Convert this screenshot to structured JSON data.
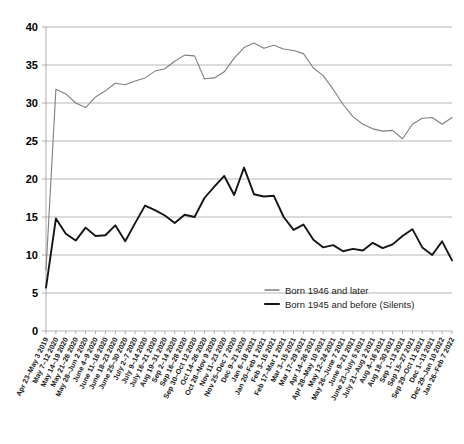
{
  "chart_data": {
    "type": "line",
    "title": "",
    "subtitle": "",
    "xlabel": "",
    "ylabel": "",
    "ylim": [
      0,
      40
    ],
    "yticks": [
      0,
      5,
      10,
      15,
      20,
      25,
      30,
      35,
      40
    ],
    "grid": true,
    "legend_position": "bottom-right",
    "colors": {
      "born_1946_and_later": "#7f7f7f",
      "born_1945_and_before": "#151515",
      "gridline": "#9a9a9a",
      "text": "#1a1a1a"
    },
    "categories": [
      "Apr 23–May 3 2019",
      "May 7–12 2020",
      "May 14–19 2020",
      "May 21–26 2020",
      "May 28–Jun 2 2020",
      "June 4–9 2020",
      "June 11–16 2020",
      "June 18–23 2020",
      "June 25–30 2020",
      "July 2–7 2020",
      "July 9–14 2020",
      "July 16–21 2020",
      "Aug 19–31 2020",
      "Sep 2–14 2020",
      "Sep 16–28 2020",
      "Sep 30–Oct 12 2020",
      "Oct 14–26 2020",
      "Oct 28–Nov 9 2020",
      "Nov 11–23 2020",
      "Nov 25–Dec 7 2020",
      "Dec 9–21 2020",
      "Jan 6–18 2021",
      "Jan 20–Feb 1 2021",
      "Feb 3–15 2021",
      "Feb 17–Mar 1 2021",
      "Mar 3–15 2021",
      "Mar 17–29 2021",
      "Apr 14–26 2021",
      "Apr 28–May 10 2021",
      "May 12–24 2021",
      "May 26–June 7 2021",
      "June 9–21 2021",
      "June 23–July 5 2021",
      "July 21–Aug 2 2021",
      "Aug 4–16 2021",
      "Aug 18–30 2021",
      "Sep 1–13 2021",
      "Sep 15–27 2021",
      "Sep 29–Oct 11 2021",
      "Dec 1–13 2021",
      "Dec 29–Jan 10 2022",
      "Jan 26–Feb 7 2022"
    ],
    "series": [
      {
        "name": "Born 1946 and later",
        "color": "#7f7f7f",
        "values": [
          8.0,
          31.8,
          31.2,
          30.0,
          29.4,
          30.8,
          31.6,
          32.6,
          32.4,
          32.9,
          33.3,
          34.2,
          34.5,
          35.5,
          36.3,
          36.2,
          33.2,
          33.3,
          34.1,
          35.9,
          37.3,
          37.9,
          37.2,
          37.6,
          37.1,
          36.9,
          36.5,
          34.6,
          33.6,
          31.8,
          29.8,
          28.2,
          27.2,
          26.6,
          26.3,
          26.4,
          25.3,
          27.2,
          28.0,
          28.1,
          27.2,
          28.1
        ]
      },
      {
        "name": "Born 1945 and before (Silents)",
        "color": "#151515",
        "values": [
          5.7,
          14.8,
          12.8,
          11.9,
          13.6,
          12.5,
          12.6,
          13.9,
          11.8,
          14.2,
          16.5,
          15.9,
          15.2,
          14.2,
          15.3,
          15.0,
          17.5,
          19.0,
          20.4,
          17.9,
          21.5,
          18.0,
          17.7,
          17.8,
          15.0,
          13.3,
          14.0,
          12.0,
          11.0,
          11.3,
          10.5,
          10.8,
          10.6,
          11.6,
          10.9,
          11.4,
          12.5,
          13.4,
          11.0,
          10.0,
          11.8,
          9.3
        ]
      }
    ],
    "legend": [
      {
        "label": "Born 1946 and later",
        "color": "#7f7f7f"
      },
      {
        "label": "Born 1945 and before (Silents)",
        "color": "#151515"
      }
    ]
  }
}
